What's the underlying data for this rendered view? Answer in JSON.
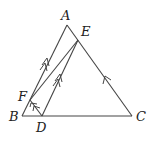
{
  "diagram": {
    "type": "geometry-triangle",
    "vertices": {
      "A": {
        "label": "A",
        "x": 67,
        "y": 25
      },
      "B": {
        "label": "B",
        "x": 22,
        "y": 116
      },
      "C": {
        "label": "C",
        "x": 132,
        "y": 116
      },
      "D": {
        "label": "D",
        "x": 42,
        "y": 116
      },
      "E": {
        "label": "E",
        "x": 78,
        "y": 40
      },
      "F": {
        "label": "F",
        "x": 30,
        "y": 100
      }
    },
    "segments": [
      "AB",
      "BC",
      "CA",
      "FE",
      "DE",
      "FD"
    ],
    "parallel_marks": {
      "double_arrow": [
        "AB",
        "DE"
      ],
      "single_arrow": [
        "CA",
        "FD"
      ]
    }
  }
}
